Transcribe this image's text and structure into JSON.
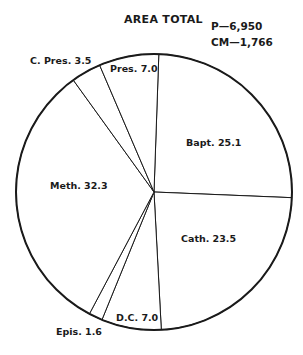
{
  "chart_data": {
    "type": "pie",
    "title": "AREA TOTAL",
    "annotations": [
      "P—6,950",
      "CM—1,766"
    ],
    "start_angle_deg": 2,
    "direction": "clockwise",
    "categories": [
      "Bapt.",
      "Cath.",
      "D.C.",
      "Epis.",
      "Meth.",
      "C. Pres.",
      "Pres."
    ],
    "values": [
      25.1,
      23.5,
      7.0,
      1.6,
      32.3,
      3.5,
      7.0
    ],
    "labels": [
      "Bapt. 25.1",
      "Cath. 23.5",
      "D.C. 7.0",
      "Epis. 1.6",
      "Meth. 32.3",
      "C. Pres. 3.5",
      "Pres. 7.0"
    ],
    "fill": "#ffffff",
    "stroke": "#1a1a1a",
    "legend": "none",
    "grid": false
  },
  "header": {
    "title": "AREA TOTAL",
    "p": "P—6,950",
    "cm": "CM—1,766"
  },
  "slices": {
    "bapt": "Bapt. 25.1",
    "cath": "Cath. 23.5",
    "dc": "D.C. 7.0",
    "epis": "Epis. 1.6",
    "meth": "Meth. 32.3",
    "cpres": "C. Pres. 3.5",
    "pres": "Pres. 7.0"
  }
}
